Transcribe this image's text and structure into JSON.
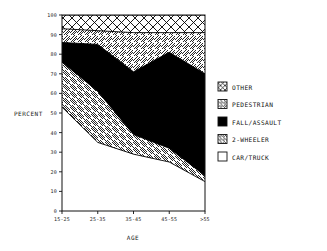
{
  "chart_data": {
    "type": "area",
    "title": "",
    "xlabel": "AGE",
    "ylabel": "PERCENT",
    "categories": [
      "15-25",
      "25-35",
      "35-45",
      "45-55",
      ">55"
    ],
    "x_tick_labels": [
      "15-25",
      "25-35",
      "35-45",
      "45-55",
      ">55"
    ],
    "y_tick_labels": [
      "0",
      "10",
      "20",
      "30",
      "40",
      "50",
      "60",
      "70",
      "80",
      "90",
      "100"
    ],
    "y_ticks": [
      0,
      10,
      20,
      30,
      40,
      50,
      60,
      70,
      80,
      90,
      100
    ],
    "ylim": [
      0,
      100
    ],
    "stacked": true,
    "grid": false,
    "legend_position": "right",
    "series": [
      {
        "name": "CAR/TRUCK",
        "pattern": "solid-white",
        "color": "#ffffff",
        "values": [
          53,
          35,
          29,
          25,
          15
        ],
        "cumulative_top": [
          53,
          35,
          29,
          25,
          15
        ]
      },
      {
        "name": "2-WHEELER",
        "pattern": "diagonal-hatch-back",
        "color": "#ffffff",
        "values": [
          23,
          26,
          10,
          7,
          3
        ],
        "cumulative_top": [
          76,
          61,
          39,
          32,
          18
        ]
      },
      {
        "name": "FALL/ASSAULT",
        "pattern": "solid-black",
        "color": "#000000",
        "values": [
          10,
          24,
          32,
          49,
          52
        ],
        "cumulative_top": [
          86,
          85,
          71,
          81,
          70
        ]
      },
      {
        "name": "PEDESTRIAN",
        "pattern": "diagonal-hatch-forward",
        "color": "#ffffff",
        "values": [
          7,
          7,
          20,
          10,
          21
        ],
        "cumulative_top": [
          93,
          92,
          91,
          91,
          91
        ]
      },
      {
        "name": "OTHER",
        "pattern": "cross-hatch",
        "color": "#ffffff",
        "values": [
          7,
          8,
          9,
          9,
          9
        ],
        "cumulative_top": [
          100,
          100,
          100,
          100,
          100
        ]
      }
    ]
  },
  "legend": {
    "items": [
      {
        "label": "OTHER",
        "swatch": "cross-hatch"
      },
      {
        "label": "PEDESTRIAN",
        "swatch": "diagonal-hatch-forward"
      },
      {
        "label": "FALL/ASSAULT",
        "swatch": "solid-black"
      },
      {
        "label": "2-WHEELER",
        "swatch": "diagonal-hatch-back"
      },
      {
        "label": "CAR/TRUCK",
        "swatch": "solid-white"
      }
    ]
  },
  "axes": {
    "y_label": "PERCENT",
    "x_label": "AGE",
    "y_tick_0": "0",
    "y_tick_10": "10",
    "y_tick_20": "20",
    "y_tick_30": "30",
    "y_tick_40": "40",
    "y_tick_50": "50",
    "y_tick_60": "60",
    "y_tick_70": "70",
    "y_tick_80": "80",
    "y_tick_90": "90",
    "y_tick_100": "100",
    "x_tick_1": "15-25",
    "x_tick_2": "25-35",
    "x_tick_3": "35-45",
    "x_tick_4": "45-55",
    "x_tick_5": ">55"
  }
}
